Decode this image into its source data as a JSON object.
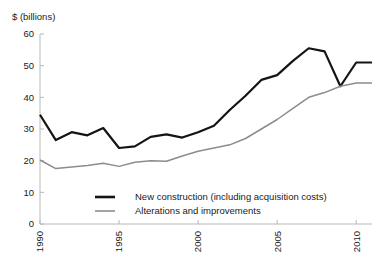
{
  "chart_data": {
    "type": "line",
    "title": "",
    "ylabel": "$ (billions)",
    "xlabel": "",
    "ylim": [
      0,
      60
    ],
    "xlim": [
      1990,
      2011
    ],
    "ytick_labels": [
      "0",
      "10",
      "20",
      "30",
      "40",
      "50",
      "60"
    ],
    "yticks": [
      0,
      10,
      20,
      30,
      40,
      50,
      60
    ],
    "xtick_labels": [
      "1990",
      "1995",
      "2000",
      "2005",
      "2010"
    ],
    "xticks": [
      1990,
      1995,
      2000,
      2005,
      2010
    ],
    "grid": false,
    "legend_position": "inside-lower-center",
    "x": [
      1990,
      1991,
      1992,
      1993,
      1994,
      1995,
      1996,
      1997,
      1998,
      1999,
      2000,
      2001,
      2002,
      2003,
      2004,
      2005,
      2006,
      2007,
      2008,
      2009,
      2010,
      2011
    ],
    "series": [
      {
        "name": "New construction (including acquisition costs)",
        "color": "#141414",
        "values": [
          34.5,
          26.5,
          29.0,
          28.0,
          30.3,
          24.0,
          24.5,
          27.5,
          28.3,
          27.3,
          29.0,
          31.0,
          36.0,
          40.5,
          45.5,
          47.0,
          51.5,
          55.5,
          54.5,
          43.5,
          51.0,
          51.0
        ]
      },
      {
        "name": "Alterations and improvements",
        "color": "#8c8c8c",
        "values": [
          20.2,
          17.5,
          18.0,
          18.5,
          19.2,
          18.2,
          19.5,
          20.0,
          19.8,
          21.5,
          23.0,
          24.0,
          25.0,
          27.0,
          30.0,
          33.0,
          36.5,
          40.0,
          41.5,
          43.5,
          44.5,
          44.5
        ]
      }
    ]
  },
  "legend": {
    "entries": [
      {
        "label": "New construction (including acquisition costs)"
      },
      {
        "label": "Alterations and improvements"
      }
    ]
  }
}
